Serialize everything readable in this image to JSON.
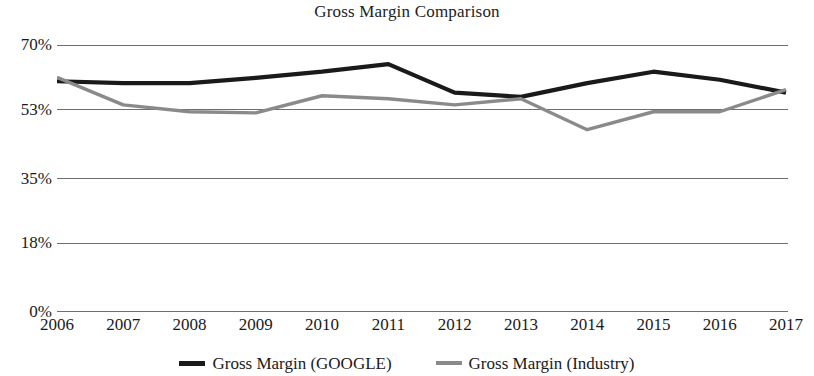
{
  "chart_data": {
    "type": "line",
    "title": "Gross Margin Comparison",
    "xlabel": "",
    "ylabel": "",
    "categories": [
      "2006",
      "2007",
      "2008",
      "2009",
      "2010",
      "2011",
      "2012",
      "2013",
      "2014",
      "2015",
      "2016",
      "2017"
    ],
    "ytick_labels": [
      "70%",
      "53%",
      "35%",
      "18%",
      "0%"
    ],
    "ytick_values": [
      70,
      53,
      35,
      18,
      0
    ],
    "ylim": [
      0,
      70
    ],
    "grid": true,
    "legend_position": "bottom",
    "series": [
      {
        "name": "Gross Margin (GOOGLE)",
        "color": "#1a1a1a",
        "values": [
          60.5,
          60.0,
          60.0,
          61.4,
          63.0,
          65.0,
          57.5,
          56.4,
          60.0,
          63.0,
          60.9,
          57.5
        ]
      },
      {
        "name": "Gross Margin (Industry)",
        "color": "#8a8a8a",
        "values": [
          61.5,
          54.3,
          52.5,
          52.2,
          56.7,
          55.9,
          54.3,
          55.9,
          47.8,
          52.5,
          52.5,
          58.3
        ]
      }
    ]
  },
  "legend": {
    "items": [
      {
        "label": "Gross Margin (GOOGLE)",
        "color": "#1a1a1a"
      },
      {
        "label": "Gross Margin (Industry)",
        "color": "#8a8a8a"
      }
    ]
  },
  "style": {
    "gridline_color": "#6e6e6e",
    "background": "#ffffff",
    "google_line_color": "#1a1a1a",
    "industry_line_color": "#8a8a8a"
  }
}
